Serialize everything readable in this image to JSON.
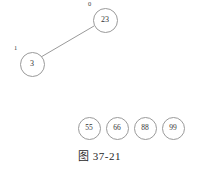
{
  "figure": {
    "caption": "图 37-21",
    "background_color": "#ffffff",
    "stroke_color": "#9a9a9a",
    "text_color": "#333333"
  },
  "tree": {
    "nodes": [
      {
        "id": "n0",
        "value": "23",
        "index_label": "0",
        "cx": 105,
        "cy": 20,
        "r": 12.5
      },
      {
        "id": "n1",
        "value": "3",
        "index_label": "1",
        "cx": 32,
        "cy": 64,
        "r": 12.5
      }
    ],
    "edges": [
      {
        "from": "n0",
        "to": "n1",
        "x1": 94,
        "y1": 26,
        "x2": 41,
        "y2": 57
      }
    ]
  },
  "free_nodes": [
    {
      "value": "55",
      "cx": 89,
      "cy": 128,
      "r": 11.5
    },
    {
      "value": "66",
      "cx": 117,
      "cy": 128,
      "r": 11.5
    },
    {
      "value": "88",
      "cx": 145,
      "cy": 128,
      "r": 11.5
    },
    {
      "value": "99",
      "cx": 173,
      "cy": 128,
      "r": 11.5
    }
  ]
}
